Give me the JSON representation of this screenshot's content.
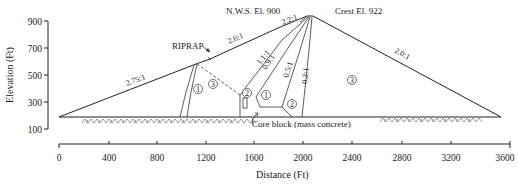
{
  "figure": {
    "type": "dam-cross-section",
    "annotations": {
      "nws": "N.W.S. El. 900",
      "crest": "Crest El. 922",
      "riprap": "RIPRAP",
      "core_block": "Core block (mass concrete)"
    },
    "slopes": {
      "upstream_lower": "2.75:1",
      "upstream_mid": "2.6:1",
      "upstream_top": "2.2:1",
      "core_up_outer": "1.1:1",
      "core_up_inner": "0.9:1",
      "core_down_inner": "0.5:1",
      "core_down_outer": "0.2:1",
      "downstream": "2.0:1"
    },
    "zones": {
      "z1_left": "1",
      "z3_left": "3",
      "z2_left": "2",
      "z1_core": "1",
      "z2_right": "2",
      "z3_right": "3"
    }
  },
  "y_axis": {
    "title": "Elevation (Ft)",
    "ticks": [
      "900",
      "700",
      "500",
      "300",
      "100"
    ]
  },
  "x_axis": {
    "title": "Distance (Ft)",
    "ticks": [
      "0",
      "400",
      "800",
      "1200",
      "1600",
      "2000",
      "2400",
      "2800",
      "3200",
      "3600"
    ]
  }
}
